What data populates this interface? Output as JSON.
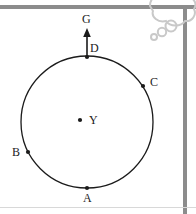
{
  "figure": {
    "type": "geometry-diagram",
    "background_color": "#ffffff",
    "stroke_color": "#1b1b1b",
    "frame_color": "#8c8c8c",
    "bubble_color": "#c9c9c9"
  },
  "circle": {
    "name": "main-circle",
    "center_x": 87,
    "center_y": 122,
    "radius": 66,
    "stroke_width": 1.3
  },
  "center_point": {
    "id": "Y",
    "label": "Y",
    "x": 80,
    "y": 120,
    "label_x": 89,
    "label_y": 114
  },
  "points": [
    {
      "id": "A",
      "label": "A",
      "x": 87,
      "y": 188,
      "label_x": 83,
      "label_y": 192,
      "angle_deg": 270
    },
    {
      "id": "B",
      "label": "B",
      "x": 28,
      "y": 152,
      "label_x": 12,
      "label_y": 146,
      "angle_deg": 207
    },
    {
      "id": "C",
      "label": "C",
      "x": 143,
      "y": 86,
      "label_x": 150,
      "label_y": 76,
      "angle_deg": 33
    },
    {
      "id": "D",
      "label": "D",
      "x": 87,
      "y": 57,
      "label_x": 90,
      "label_y": 42,
      "angle_deg": 90
    }
  ],
  "arrow": {
    "name": "tangent-arrow",
    "label": "G",
    "from_x": 87,
    "from_y": 57,
    "to_x": 87,
    "to_y": 29,
    "label_x": 82,
    "label_y": 13,
    "stroke_width": 1.6
  },
  "frame": {
    "top_bar": {
      "x": 0,
      "y": 5,
      "width": 196,
      "height": 4
    },
    "right_bar": {
      "x": 183,
      "y": 9,
      "width": 4,
      "height": 205
    },
    "bottom_rule": {
      "x": 0,
      "y": 207,
      "width": 196,
      "height": 1
    }
  },
  "thought_bubble": {
    "name": "thought-bubble",
    "visible": true,
    "note": "partially cropped cloud shape with trailing circles at top-right"
  }
}
